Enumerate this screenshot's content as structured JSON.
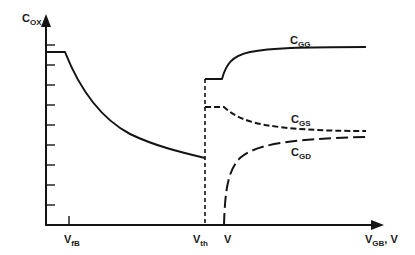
{
  "diagram": {
    "y_axis": {
      "label_main": "C",
      "label_sub": "OX"
    },
    "x_axis": {
      "label_main": "V",
      "label_sub": "GB",
      "label_suffix": ", V"
    },
    "x_markers": [
      {
        "main": "V",
        "sub": "fB"
      },
      {
        "main": "V",
        "sub": "th"
      },
      {
        "main": "V",
        "sub": ""
      }
    ],
    "curves": [
      {
        "name": "C",
        "sub": "GG",
        "style": "solid"
      },
      {
        "name": "C",
        "sub": "GS",
        "style": "short-dash"
      },
      {
        "name": "C",
        "sub": "GD",
        "style": "long-dash"
      }
    ],
    "line_color": "#141414",
    "background": "#ffffff"
  }
}
